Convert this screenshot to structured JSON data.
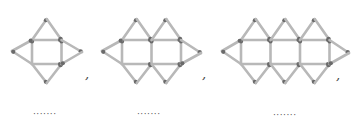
{
  "figure": {
    "colors": {
      "stick": "#b8b8b8",
      "head": "#6a6a6a",
      "background": "#ffffff"
    },
    "patterns": [
      {
        "index": 1,
        "squares": 1,
        "x0": 32,
        "left_apex": [
          12,
          51
        ],
        "right_apex": [
          82,
          52
        ],
        "comma": ",",
        "blank": "·······"
      },
      {
        "index": 2,
        "squares": 2,
        "x0": 122,
        "left_apex": [
          102,
          51
        ],
        "right_apex": [
          201,
          53
        ],
        "comma": ",",
        "blank": "·······"
      },
      {
        "index": 3,
        "squares": 3,
        "x0": 241,
        "left_apex": [
          222,
          51
        ],
        "right_apex": [
          349,
          53
        ],
        "comma": ",",
        "blank": "·······"
      }
    ],
    "square_size": 29.5,
    "top_y": 40,
    "bottom_y": 64,
    "apex_top_y": 19,
    "apex_bottom_y": 83
  },
  "labels": {
    "comma_1": ",",
    "comma_2": ",",
    "comma_3": ",",
    "blank_1": "·······",
    "blank_2": "·······",
    "blank_3": "·······"
  }
}
